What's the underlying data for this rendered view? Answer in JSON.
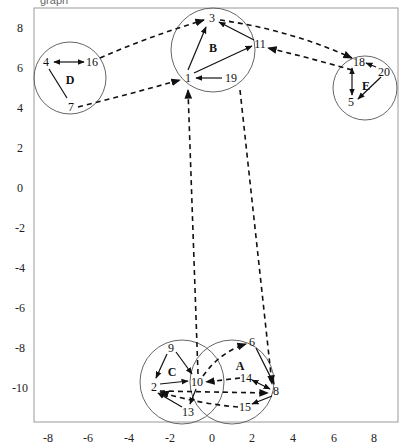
{
  "figure": {
    "title_fragment": "graph",
    "frame": {
      "x0": 34,
      "y0": 8,
      "x1": 398,
      "y1": 422
    }
  },
  "axes": {
    "x_ticks": [
      {
        "label": "-8",
        "x": 48
      },
      {
        "label": "-6",
        "x": 88
      },
      {
        "label": "-4",
        "x": 129
      },
      {
        "label": "-2",
        "x": 170
      },
      {
        "label": "0",
        "x": 212
      },
      {
        "label": "2",
        "x": 252
      },
      {
        "label": "4",
        "x": 293
      },
      {
        "label": "6",
        "x": 334
      },
      {
        "label": "8",
        "x": 374
      }
    ],
    "y_ticks": [
      {
        "label": "8",
        "y": 28
      },
      {
        "label": "6",
        "y": 68
      },
      {
        "label": "4",
        "y": 108
      },
      {
        "label": "2",
        "y": 148
      },
      {
        "label": "0",
        "y": 188
      },
      {
        "label": "-2",
        "y": 228
      },
      {
        "label": "-4",
        "y": 268
      },
      {
        "label": "-6",
        "y": 308
      },
      {
        "label": "-8",
        "y": 348
      },
      {
        "label": "-10",
        "y": 388
      }
    ]
  },
  "clusters": [
    {
      "id": "D",
      "cx": 70,
      "cy": 78,
      "r": 36,
      "label_x": 70,
      "label_y": 80
    },
    {
      "id": "B",
      "cx": 213,
      "cy": 50,
      "r": 42,
      "label_x": 213,
      "label_y": 48
    },
    {
      "id": "E",
      "cx": 365,
      "cy": 88,
      "r": 32,
      "label_x": 366,
      "label_y": 86
    },
    {
      "id": "C",
      "cx": 182,
      "cy": 382,
      "r": 42,
      "label_x": 172,
      "label_y": 372
    },
    {
      "id": "A",
      "cx": 232,
      "cy": 382,
      "r": 42,
      "label_x": 240,
      "label_y": 366
    }
  ],
  "nodes": [
    {
      "id": "4",
      "x": 46,
      "y": 62
    },
    {
      "id": "16",
      "x": 92,
      "y": 62
    },
    {
      "id": "7",
      "x": 71,
      "y": 107
    },
    {
      "id": "3",
      "x": 212,
      "y": 18
    },
    {
      "id": "11",
      "x": 260,
      "y": 44
    },
    {
      "id": "1",
      "x": 188,
      "y": 78
    },
    {
      "id": "19",
      "x": 231,
      "y": 78
    },
    {
      "id": "18",
      "x": 359,
      "y": 62
    },
    {
      "id": "20",
      "x": 384,
      "y": 72
    },
    {
      "id": "5",
      "x": 351,
      "y": 102
    },
    {
      "id": "9",
      "x": 171,
      "y": 348
    },
    {
      "id": "2",
      "x": 154,
      "y": 387
    },
    {
      "id": "10",
      "x": 197,
      "y": 382
    },
    {
      "id": "13",
      "x": 188,
      "y": 412
    },
    {
      "id": "6",
      "x": 252,
      "y": 342
    },
    {
      "id": "14",
      "x": 246,
      "y": 378
    },
    {
      "id": "8",
      "x": 276,
      "y": 391
    },
    {
      "id": "15",
      "x": 245,
      "y": 407
    }
  ],
  "edges_solid": [
    {
      "from": "16",
      "to": "4",
      "x1": 84,
      "y1": 62,
      "x2": 54,
      "y2": 62,
      "bidirectional": true
    },
    {
      "from": "4",
      "to": "7",
      "x1": 49,
      "y1": 69,
      "x2": 67,
      "y2": 98,
      "bidirectional": false
    },
    {
      "from": "1",
      "to": "3",
      "x1": 188,
      "y1": 70,
      "x2": 206,
      "y2": 27
    },
    {
      "from": "11",
      "to": "3",
      "x1": 254,
      "y1": 40,
      "x2": 219,
      "y2": 22
    },
    {
      "from": "1",
      "to": "11",
      "x1": 194,
      "y1": 73,
      "x2": 252,
      "y2": 46
    },
    {
      "from": "19",
      "to": "1",
      "x1": 222,
      "y1": 78,
      "x2": 196,
      "y2": 78
    },
    {
      "from": "20",
      "to": "18",
      "x1": 376,
      "y1": 67,
      "x2": 366,
      "y2": 63
    },
    {
      "from": "18",
      "to": "5",
      "x1": 352,
      "y1": 68,
      "x2": 352,
      "y2": 95,
      "bidirectional": true
    },
    {
      "from": "20",
      "to": "5",
      "x1": 381,
      "y1": 77,
      "x2": 358,
      "y2": 99
    },
    {
      "from": "9",
      "to": "2",
      "x1": 167,
      "y1": 354,
      "x2": 156,
      "y2": 378
    },
    {
      "from": "9",
      "to": "10",
      "x1": 176,
      "y1": 352,
      "x2": 192,
      "y2": 374
    },
    {
      "from": "2",
      "to": "10",
      "x1": 160,
      "y1": 384,
      "x2": 188,
      "y2": 381
    },
    {
      "from": "13",
      "to": "2",
      "x1": 182,
      "y1": 407,
      "x2": 158,
      "y2": 393
    },
    {
      "from": "10",
      "to": "13",
      "x1": 196,
      "y1": 389,
      "x2": 190,
      "y2": 404
    },
    {
      "from": "6",
      "to": "8",
      "x1": 256,
      "y1": 348,
      "x2": 274,
      "y2": 384
    },
    {
      "from": "8",
      "to": "14",
      "x1": 270,
      "y1": 389,
      "x2": 252,
      "y2": 380,
      "bidirectional": true
    },
    {
      "from": "8",
      "to": "15",
      "x1": 272,
      "y1": 396,
      "x2": 252,
      "y2": 404
    }
  ],
  "edges_dashed": [
    {
      "from": "16",
      "to": "3",
      "path": "M 100 58 Q 150 36 204 20"
    },
    {
      "from": "7",
      "to": "1",
      "path": "M 78 107 Q 130 94 180 80"
    },
    {
      "from": "3",
      "to": "18",
      "path": "M 220 20 Q 290 30 352 58"
    },
    {
      "from": "18",
      "to": "11",
      "path": "M 352 70 Q 310 58 268 48"
    },
    {
      "from": "10",
      "to": "1",
      "path": "M 198 374 L 188 90"
    },
    {
      "from": "19",
      "to": "8",
      "path": "M 240 90 L 272 384"
    },
    {
      "from": "10",
      "to": "6",
      "path": "M 203 376 Q 220 352 246 344"
    },
    {
      "from": "14",
      "to": "10",
      "path": "M 240 378 L 206 382"
    },
    {
      "from": "2",
      "to": "8",
      "path": "M 160 391 L 268 393"
    },
    {
      "from": "15",
      "to": "2",
      "path": "M 238 407 Q 200 404 160 392"
    }
  ]
}
